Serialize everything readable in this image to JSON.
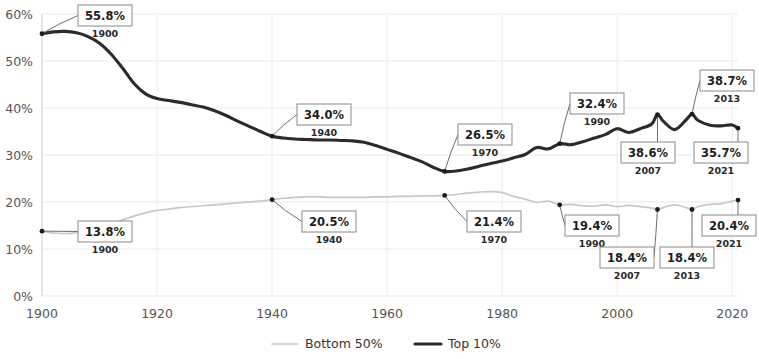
{
  "chart_data": {
    "type": "line",
    "title": "",
    "subtitle": "",
    "xlabel": "",
    "ylabel": "",
    "xlim": [
      1900,
      2021
    ],
    "ylim": [
      0,
      60
    ],
    "grid": true,
    "legend_position": "bottom",
    "x_ticks": [
      "1900",
      "1920",
      "1940",
      "1960",
      "1980",
      "2000",
      "2020"
    ],
    "x_tick_values": [
      1900,
      1920,
      1940,
      1960,
      1980,
      2000,
      2020
    ],
    "y_ticks": [
      "0%",
      "10%",
      "20%",
      "30%",
      "40%",
      "50%",
      "60%"
    ],
    "y_tick_values": [
      0,
      10,
      20,
      30,
      40,
      50,
      60
    ],
    "series": [
      {
        "name": "Top 10%",
        "color": "#2b2b2b",
        "style": "solid-thick",
        "x": [
          1900,
          1902,
          1904,
          1906,
          1908,
          1910,
          1912,
          1914,
          1916,
          1918,
          1920,
          1922,
          1924,
          1926,
          1928,
          1930,
          1932,
          1934,
          1936,
          1938,
          1940,
          1942,
          1944,
          1946,
          1948,
          1950,
          1952,
          1954,
          1956,
          1958,
          1960,
          1962,
          1964,
          1966,
          1968,
          1970,
          1972,
          1974,
          1976,
          1978,
          1980,
          1982,
          1984,
          1986,
          1988,
          1990,
          1992,
          1994,
          1996,
          1998,
          2000,
          2002,
          2004,
          2006,
          2007,
          2008,
          2010,
          2012,
          2013,
          2014,
          2016,
          2018,
          2020,
          2021
        ],
        "values": [
          55.8,
          56.2,
          56.3,
          56.0,
          55.2,
          53.8,
          51.5,
          48.5,
          45.2,
          43.0,
          42.0,
          41.6,
          41.2,
          40.7,
          40.2,
          39.4,
          38.4,
          37.2,
          36.1,
          35.0,
          34.0,
          33.6,
          33.4,
          33.3,
          33.2,
          33.2,
          33.1,
          33.0,
          32.7,
          32.0,
          31.2,
          30.4,
          29.5,
          28.6,
          27.4,
          26.5,
          26.6,
          27.0,
          27.6,
          28.2,
          28.7,
          29.4,
          30.1,
          31.6,
          31.3,
          32.4,
          32.2,
          32.8,
          33.6,
          34.4,
          35.6,
          34.8,
          35.6,
          36.6,
          38.6,
          37.2,
          35.4,
          37.5,
          38.7,
          37.4,
          36.4,
          36.2,
          36.4,
          35.7
        ]
      },
      {
        "name": "Bottom 50%",
        "color": "#c8c8c8",
        "style": "solid-thin",
        "x": [
          1900,
          1902,
          1904,
          1906,
          1908,
          1910,
          1912,
          1914,
          1916,
          1918,
          1920,
          1922,
          1924,
          1926,
          1928,
          1930,
          1932,
          1934,
          1936,
          1938,
          1940,
          1942,
          1944,
          1946,
          1948,
          1950,
          1952,
          1954,
          1956,
          1958,
          1960,
          1962,
          1964,
          1966,
          1968,
          1970,
          1972,
          1974,
          1976,
          1978,
          1980,
          1982,
          1984,
          1986,
          1988,
          1990,
          1992,
          1994,
          1996,
          1998,
          2000,
          2002,
          2004,
          2006,
          2007,
          2008,
          2010,
          2012,
          2013,
          2014,
          2016,
          2018,
          2020,
          2021
        ],
        "values": [
          13.8,
          13.4,
          13.3,
          13.5,
          14.0,
          14.6,
          15.4,
          16.2,
          17.0,
          17.7,
          18.2,
          18.5,
          18.8,
          19.0,
          19.2,
          19.4,
          19.6,
          19.8,
          20.0,
          20.2,
          20.5,
          20.8,
          21.0,
          21.1,
          21.1,
          21.0,
          21.0,
          21.0,
          21.0,
          21.1,
          21.1,
          21.2,
          21.2,
          21.3,
          21.3,
          21.4,
          21.6,
          21.9,
          22.1,
          22.2,
          22.0,
          21.2,
          20.6,
          19.9,
          20.2,
          19.4,
          19.5,
          19.2,
          19.1,
          19.4,
          19.0,
          19.3,
          19.0,
          18.7,
          18.4,
          18.8,
          19.4,
          18.8,
          18.4,
          19.0,
          19.5,
          19.6,
          20.2,
          20.4
        ]
      }
    ],
    "callouts": [
      {
        "id": "top-1900",
        "series": "Top 10%",
        "value": "55.8%",
        "year": "1900",
        "value_num": 55.8,
        "year_num": 1900
      },
      {
        "id": "top-1940",
        "series": "Top 10%",
        "value": "34.0%",
        "year": "1940",
        "value_num": 34.0,
        "year_num": 1940
      },
      {
        "id": "top-1970",
        "series": "Top 10%",
        "value": "26.5%",
        "year": "1970",
        "value_num": 26.5,
        "year_num": 1970
      },
      {
        "id": "top-1990",
        "series": "Top 10%",
        "value": "32.4%",
        "year": "1990",
        "value_num": 32.4,
        "year_num": 1990
      },
      {
        "id": "top-2007",
        "series": "Top 10%",
        "value": "38.6%",
        "year": "2007",
        "value_num": 38.6,
        "year_num": 2007
      },
      {
        "id": "top-2013",
        "series": "Top 10%",
        "value": "38.7%",
        "year": "2013",
        "value_num": 38.7,
        "year_num": 2013
      },
      {
        "id": "top-2021",
        "series": "Top 10%",
        "value": "35.7%",
        "year": "2021",
        "value_num": 35.7,
        "year_num": 2021
      },
      {
        "id": "bot-1900",
        "series": "Bottom 50%",
        "value": "13.8%",
        "year": "1900",
        "value_num": 13.8,
        "year_num": 1900
      },
      {
        "id": "bot-1940",
        "series": "Bottom 50%",
        "value": "20.5%",
        "year": "1940",
        "value_num": 20.5,
        "year_num": 1940
      },
      {
        "id": "bot-1970",
        "series": "Bottom 50%",
        "value": "21.4%",
        "year": "1970",
        "value_num": 21.4,
        "year_num": 1970
      },
      {
        "id": "bot-1990",
        "series": "Bottom 50%",
        "value": "19.4%",
        "year": "1990",
        "value_num": 19.4,
        "year_num": 1990
      },
      {
        "id": "bot-2007",
        "series": "Bottom 50%",
        "value": "18.4%",
        "year": "2007",
        "value_num": 18.4,
        "year_num": 2007
      },
      {
        "id": "bot-2013",
        "series": "Bottom 50%",
        "value": "18.4%",
        "year": "2013",
        "value_num": 18.4,
        "year_num": 2013
      },
      {
        "id": "bot-2021",
        "series": "Bottom 50%",
        "value": "20.4%",
        "year": "2021",
        "value_num": 20.4,
        "year_num": 2021
      }
    ],
    "legend": [
      {
        "label": "Bottom 50%",
        "color": "#c8c8c8",
        "style": "solid-thin"
      },
      {
        "label": "Top 10%",
        "color": "#2b2b2b",
        "style": "solid-thick"
      }
    ]
  },
  "colors": {
    "background": "#ffffff",
    "grid": "#e9e9ea",
    "tick_text": "#555555",
    "callout_border": "#8a8a8a",
    "callout_text": "#1d1d1d",
    "top_series": "#2b2b2b",
    "bottom_series": "#c8c8c8"
  }
}
